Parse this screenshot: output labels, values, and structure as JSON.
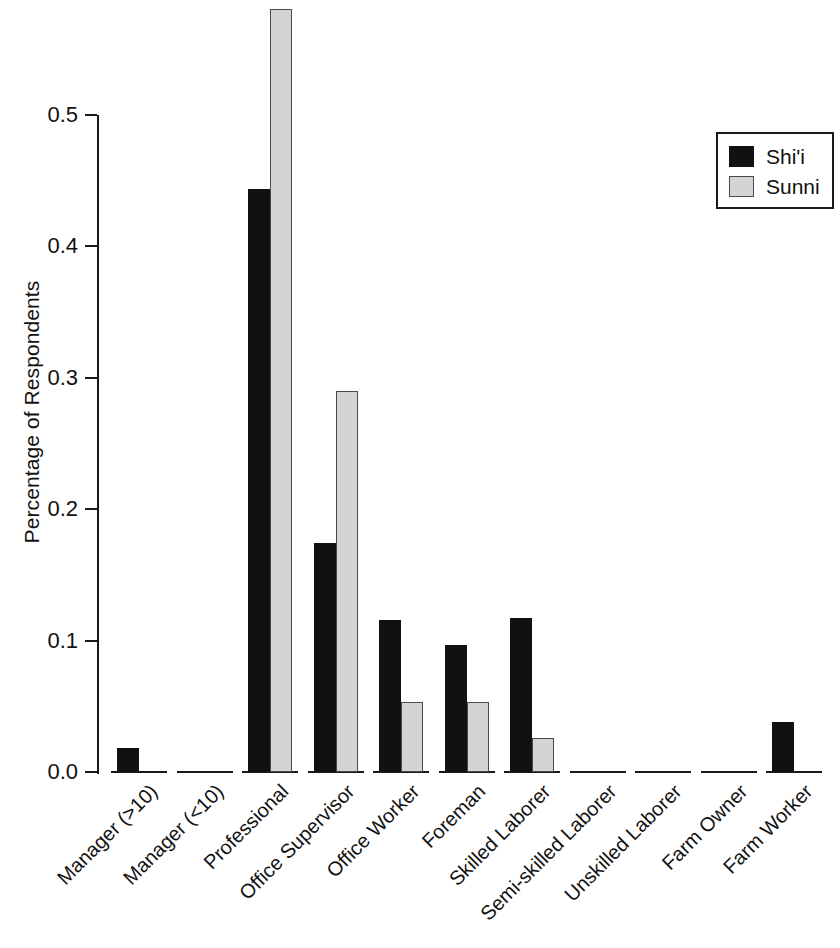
{
  "chart_data": {
    "type": "bar",
    "title": "",
    "subtitle": "",
    "xlabel": "",
    "ylabel": "Percentage of Respondents",
    "ylim": [
      0.0,
      0.6
    ],
    "yticks": [
      "0.0",
      "0.1",
      "0.2",
      "0.3",
      "0.4",
      "0.5"
    ],
    "ytick_values": [
      0.0,
      0.1,
      0.2,
      0.3,
      0.4,
      0.5
    ],
    "grid": false,
    "legend_position": "top-right",
    "categories": [
      "Manager (>10)",
      "Manager (<10)",
      "Professional",
      "Office Supervisor",
      "Office Worker",
      "Foreman",
      "Skilled Laborer",
      "Semi-skilled Laborer",
      "Unskilled Laborer",
      "Farm Owner",
      "Farm Worker"
    ],
    "series": [
      {
        "name": "Shi'i",
        "color": "#111111",
        "values": [
          0.018,
          0.0,
          0.444,
          0.174,
          0.116,
          0.097,
          0.117,
          0.0,
          0.0,
          0.0,
          0.038
        ]
      },
      {
        "name": "Sunni",
        "color": "#d4d4d4",
        "values": [
          0.0,
          0.0,
          0.581,
          0.29,
          0.053,
          0.053,
          0.026,
          0.0,
          0.0,
          0.0,
          0.0
        ]
      }
    ]
  },
  "legend": {
    "entries": [
      {
        "label": "Shi'i"
      },
      {
        "label": "Sunni"
      }
    ]
  }
}
